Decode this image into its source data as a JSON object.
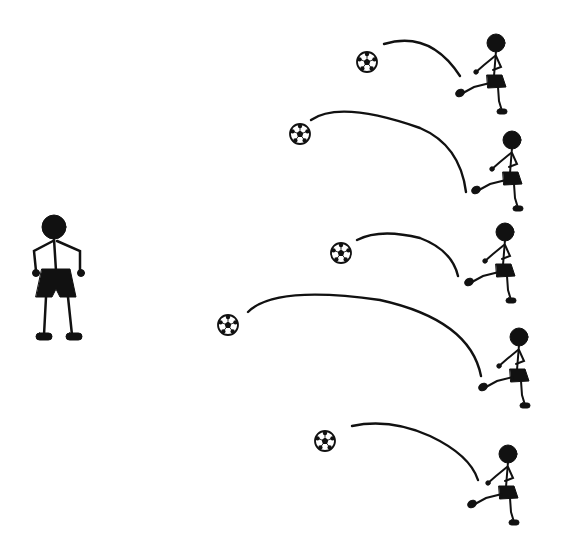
{
  "scene": {
    "description": "Soccer passing drill: one standing receiver on the left, five players on the right each kicking a ball along a curved arc toward the left",
    "ink_color": "#111111",
    "background": "#ffffff"
  },
  "receiver": {
    "head": [
      54,
      227
    ],
    "head_r": 12
  },
  "kicks": [
    {
      "ball": [
        367,
        62
      ],
      "arc": "M384,44 Q430,30 460,76",
      "kicker": [
        496,
        43
      ]
    },
    {
      "ball": [
        300,
        134
      ],
      "arc": "M311,120 Q340,100 420,128 Q460,145 466,192",
      "kicker": [
        512,
        140
      ]
    },
    {
      "ball": [
        341,
        253
      ],
      "arc": "M357,240 Q380,228 420,238 Q452,250 458,276",
      "kicker": [
        505,
        232
      ]
    },
    {
      "ball": [
        228,
        325
      ],
      "arc": "M248,312 Q275,285 380,300 Q470,320 481,376",
      "kicker": [
        519,
        337
      ]
    },
    {
      "ball": [
        325,
        441
      ],
      "arc": "M352,426 Q390,418 430,436 Q470,455 478,480",
      "kicker": [
        508,
        454
      ]
    }
  ]
}
